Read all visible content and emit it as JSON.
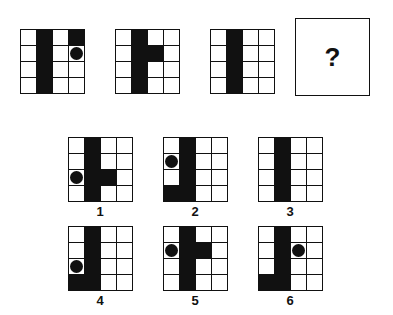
{
  "question_mark": "?",
  "sequence": [
    {
      "x": 20,
      "y": 29,
      "black": [
        [
          0,
          1
        ],
        [
          1,
          1
        ],
        [
          2,
          1
        ],
        [
          3,
          1
        ],
        [
          0,
          3
        ]
      ],
      "dots": [
        [
          1,
          3
        ]
      ]
    },
    {
      "x": 115,
      "y": 29,
      "black": [
        [
          0,
          1
        ],
        [
          1,
          1
        ],
        [
          2,
          1
        ],
        [
          3,
          1
        ],
        [
          1,
          2
        ]
      ],
      "dots": []
    },
    {
      "x": 210,
      "y": 29,
      "black": [
        [
          0,
          1
        ],
        [
          1,
          1
        ],
        [
          2,
          1
        ],
        [
          3,
          1
        ]
      ],
      "dots": []
    }
  ],
  "options": [
    {
      "label": "1",
      "x": 68,
      "y": 137,
      "black": [
        [
          0,
          1
        ],
        [
          1,
          1
        ],
        [
          2,
          1
        ],
        [
          3,
          1
        ],
        [
          2,
          2
        ]
      ],
      "dots": [
        [
          2,
          0
        ]
      ]
    },
    {
      "label": "2",
      "x": 163,
      "y": 137,
      "black": [
        [
          0,
          1
        ],
        [
          1,
          1
        ],
        [
          2,
          1
        ],
        [
          3,
          1
        ],
        [
          3,
          0
        ]
      ],
      "dots": [
        [
          1,
          0
        ]
      ]
    },
    {
      "label": "3",
      "x": 258,
      "y": 137,
      "black": [
        [
          0,
          1
        ],
        [
          1,
          1
        ],
        [
          2,
          1
        ],
        [
          3,
          1
        ]
      ],
      "dots": []
    },
    {
      "label": "4",
      "x": 68,
      "y": 226,
      "black": [
        [
          0,
          1
        ],
        [
          1,
          1
        ],
        [
          2,
          1
        ],
        [
          3,
          1
        ],
        [
          3,
          0
        ]
      ],
      "dots": [
        [
          2,
          0
        ]
      ]
    },
    {
      "label": "5",
      "x": 163,
      "y": 226,
      "black": [
        [
          0,
          1
        ],
        [
          1,
          1
        ],
        [
          2,
          1
        ],
        [
          3,
          1
        ],
        [
          1,
          2
        ]
      ],
      "dots": [
        [
          1,
          0
        ]
      ]
    },
    {
      "label": "6",
      "x": 258,
      "y": 226,
      "black": [
        [
          0,
          1
        ],
        [
          1,
          1
        ],
        [
          2,
          1
        ],
        [
          3,
          1
        ],
        [
          3,
          0
        ]
      ],
      "dots": [
        [
          1,
          2
        ]
      ]
    }
  ]
}
